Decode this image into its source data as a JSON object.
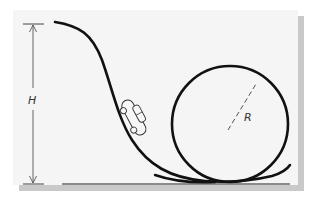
{
  "figure": {
    "labels": {
      "height": "H",
      "radius": "R"
    },
    "elements": [
      {
        "name": "track",
        "type": "curve",
        "description": "descending ramp from top-left into loop"
      },
      {
        "name": "loop",
        "type": "circle",
        "description": "vertical loop-the-loop"
      },
      {
        "name": "car",
        "type": "object",
        "description": "small car on the descending track"
      },
      {
        "name": "ground",
        "type": "line",
        "description": "horizontal ground reference"
      },
      {
        "name": "height-dimension",
        "type": "arrow",
        "label": "H"
      },
      {
        "name": "radius-dimension",
        "type": "dashed-line",
        "label": "R"
      }
    ],
    "colors": {
      "panel_bg": "#f5f5f5",
      "shadow": "#c9c9c9",
      "stroke": "#111111",
      "dimension": "#555555"
    }
  }
}
